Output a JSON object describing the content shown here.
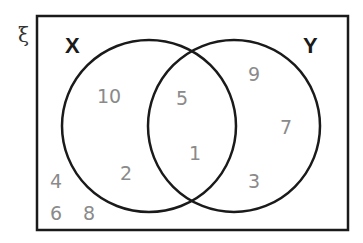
{
  "universal_symbol": "ξ",
  "sets": {
    "x": {
      "label": "X"
    },
    "y": {
      "label": "Y"
    }
  },
  "regions": {
    "x_only": [
      "10",
      "2"
    ],
    "intersection": [
      "5",
      "1"
    ],
    "y_only": [
      "9",
      "7",
      "3"
    ],
    "outside": [
      "4",
      "6",
      "8"
    ]
  },
  "colors": {
    "lines": "#1a1a1a",
    "numbers": "#8a8a8a"
  }
}
